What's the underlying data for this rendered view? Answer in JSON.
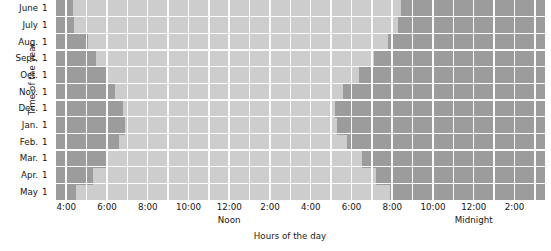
{
  "chart_data": {
    "type": "heatmap",
    "title": "",
    "xlabel": "Hours of the day",
    "ylabel": "Time of the year",
    "grid": true,
    "legend_position": "none",
    "x_axis": {
      "tick_labels": [
        "4:00",
        "6:00",
        "8:00",
        "10:00",
        "12:00",
        "2:00",
        "4:00",
        "6:00",
        "8:00",
        "10:00",
        "12:00",
        "2:00"
      ],
      "tick_hours": [
        4,
        6,
        8,
        10,
        12,
        14,
        16,
        18,
        20,
        22,
        24,
        26
      ],
      "anchor_labels": [
        {
          "label": "Noon",
          "hour": 12
        },
        {
          "label": "Midnight",
          "hour": 24
        }
      ],
      "range_hours": [
        3.5,
        27.5
      ],
      "hours_per_column": 1,
      "column_count": 24
    },
    "y_axis": {
      "tick_labels": [
        "June 1",
        "July 1",
        "Aug. 1",
        "Sept. 1",
        "Oct. 1",
        "Nov. 1",
        "Dec. 1",
        "Jan. 1",
        "Feb. 1",
        "Mar. 1",
        "Apr. 1",
        "May 1"
      ],
      "months": [
        "June",
        "July",
        "Aug.",
        "Sept.",
        "Oct.",
        "Nov.",
        "Dec.",
        "Jan.",
        "Feb.",
        "Mar.",
        "Apr.",
        "May"
      ],
      "day": "1",
      "row_count": 12
    },
    "categories_x": [
      "4:00",
      "5:00",
      "6:00",
      "7:00",
      "8:00",
      "9:00",
      "10:00",
      "11:00",
      "12:00",
      "1:00",
      "2:00",
      "3:00",
      "4:00",
      "5:00",
      "6:00",
      "7:00",
      "8:00",
      "9:00",
      "10:00",
      "11:00",
      "12:00",
      "1:00",
      "2:00",
      "3:00"
    ],
    "series": [
      {
        "name": "Sunrise (hour of day)",
        "values": [
          4.3,
          4.4,
          5.0,
          5.4,
          5.9,
          6.4,
          6.8,
          6.9,
          6.6,
          6.0,
          5.3,
          4.5
        ]
      },
      {
        "name": "Sunset (hour of day)",
        "values": [
          20.4,
          20.3,
          19.8,
          19.1,
          18.3,
          17.6,
          17.2,
          17.3,
          17.8,
          18.5,
          19.2,
          19.9
        ]
      }
    ],
    "encoding": {
      "night_label": "Night (dark)",
      "day_label": "Daylight (light)",
      "night_color": "#9c9c9c",
      "day_color": "#cdcdcd",
      "grid_color": "#fbfbfb"
    },
    "night_spans_by_row": [
      {
        "month": "June",
        "night_left_end_hour": 4.35,
        "night_right_start_hour": 20.45
      },
      {
        "month": "July",
        "night_left_end_hour": 4.4,
        "night_right_start_hour": 20.3
      },
      {
        "month": "Aug.",
        "night_left_end_hour": 5.05,
        "night_right_start_hour": 19.8
      },
      {
        "month": "Sept.",
        "night_left_end_hour": 5.45,
        "night_right_start_hour": 19.1
      },
      {
        "month": "Oct.",
        "night_left_end_hour": 5.95,
        "night_right_start_hour": 18.35
      },
      {
        "month": "Nov.",
        "night_left_end_hour": 6.4,
        "night_right_start_hour": 17.6
      },
      {
        "month": "Dec.",
        "night_left_end_hour": 6.8,
        "night_right_start_hour": 17.2
      },
      {
        "month": "Jan.",
        "night_left_end_hour": 6.9,
        "night_right_start_hour": 17.3
      },
      {
        "month": "Feb.",
        "night_left_end_hour": 6.6,
        "night_right_start_hour": 17.8
      },
      {
        "month": "Mar.",
        "night_left_end_hour": 6.0,
        "night_right_start_hour": 18.5
      },
      {
        "month": "Apr.",
        "night_left_end_hour": 5.3,
        "night_right_start_hour": 19.2
      },
      {
        "month": "May",
        "night_left_end_hour": 4.5,
        "night_right_start_hour": 19.9
      }
    ]
  }
}
